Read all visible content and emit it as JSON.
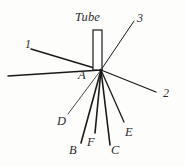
{
  "figure": {
    "type": "technical-line-diagram",
    "background_color": "#fdfdfc",
    "ink_color": "#1a1a1a",
    "width": 185,
    "height": 166,
    "tube": {
      "label": "Tube",
      "shape": "narrow-vertical-rectangle",
      "x": 93,
      "y": 30,
      "w": 9,
      "h": 40,
      "label_x": 75,
      "label_y": 11
    },
    "vertex": {
      "label": "A",
      "x": 101,
      "y": 70,
      "label_x": 78,
      "label_y": 69
    },
    "numbered_labels": [
      {
        "name": "1",
        "x": 25,
        "y": 38
      },
      {
        "name": "2",
        "x": 163,
        "y": 87
      },
      {
        "name": "3",
        "x": 137,
        "y": 12
      }
    ],
    "point_labels": [
      {
        "name": "D",
        "x": 57,
        "y": 115
      },
      {
        "name": "B",
        "x": 69,
        "y": 144
      },
      {
        "name": "F",
        "x": 87,
        "y": 136
      },
      {
        "name": "C",
        "x": 111,
        "y": 144
      },
      {
        "name": "E",
        "x": 125,
        "y": 126
      }
    ],
    "rays": [
      {
        "name": "ray-1-upper-left",
        "x1": 101,
        "y1": 70,
        "x2": 31,
        "y2": 49,
        "weight": 1.5
      },
      {
        "name": "ray-lower-left",
        "x1": 101,
        "y1": 70,
        "x2": 8,
        "y2": 76,
        "weight": 1.5
      },
      {
        "name": "ray-2-right",
        "x1": 101,
        "y1": 70,
        "x2": 156,
        "y2": 92,
        "weight": 1.3
      },
      {
        "name": "ray-3-upper-right",
        "x1": 101,
        "y1": 70,
        "x2": 134,
        "y2": 21,
        "weight": 1.0
      },
      {
        "name": "ray-D",
        "x1": 101,
        "y1": 70,
        "x2": 68,
        "y2": 114,
        "weight": 0.8
      },
      {
        "name": "ray-B",
        "x1": 101,
        "y1": 70,
        "x2": 81,
        "y2": 143,
        "weight": 1.6
      },
      {
        "name": "ray-F",
        "x1": 101,
        "y1": 70,
        "x2": 95,
        "y2": 133,
        "weight": 1.6
      },
      {
        "name": "ray-C",
        "x1": 101,
        "y1": 70,
        "x2": 110,
        "y2": 145,
        "weight": 1.6
      },
      {
        "name": "ray-E",
        "x1": 101,
        "y1": 70,
        "x2": 124,
        "y2": 122,
        "weight": 1.3
      }
    ]
  }
}
